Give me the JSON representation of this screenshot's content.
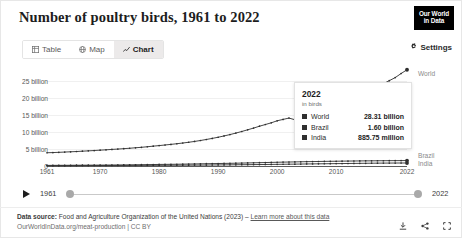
{
  "header": {
    "title": "Number of poultry birds, 1961 to 2022",
    "logo_line1": "Our World",
    "logo_line2": "in Data"
  },
  "tabs": [
    {
      "label": "Table",
      "icon": "table-icon",
      "active": false
    },
    {
      "label": "Map",
      "icon": "globe-icon",
      "active": false
    },
    {
      "label": "Chart",
      "icon": "chart-line-icon",
      "active": true
    }
  ],
  "settings": {
    "label": "Settings",
    "icon": "gear-icon"
  },
  "tooltip": {
    "year": "2022",
    "unit": "in birds",
    "rows": [
      {
        "name": "World",
        "value": "28.31 billion",
        "color": "#2f2f2f"
      },
      {
        "name": "Brazil",
        "value": "1.60 billion",
        "color": "#2f2f2f"
      },
      {
        "name": "India",
        "value": "885.75 million",
        "color": "#2f2f2f"
      }
    ]
  },
  "series_labels": [
    {
      "label": "World",
      "y": 73
    },
    {
      "label": "Brazil",
      "y": 155
    },
    {
      "label": "India",
      "y": 163
    }
  ],
  "timeline": {
    "play_icon": "play-icon",
    "start_year": "1961",
    "end_year": "2022"
  },
  "footer": {
    "source_prefix": "Data source:",
    "source_text": "Food and Agriculture Organization of the United Nations (2023)",
    "source_dash": "–",
    "source_link": "Learn more about this data",
    "license": "OurWorldInData.org/meat-production | CC BY",
    "icons": [
      "download-icon",
      "share-icon",
      "expand-icon"
    ]
  },
  "chart_data": {
    "type": "line",
    "title": "Number of poultry birds, 1961 to 2022",
    "xlabel": "",
    "ylabel": "",
    "unit": "birds",
    "grid": true,
    "legend_position": "right",
    "xlim": [
      1961,
      2022
    ],
    "ylim": [
      0,
      25000000000
    ],
    "ytick_labels": [
      "0",
      "5 billion",
      "10 billion",
      "15 billion",
      "20 billion",
      "25 billion"
    ],
    "ytick_values": [
      0,
      5000000000,
      10000000000,
      15000000000,
      20000000000,
      25000000000
    ],
    "xtick_labels": [
      "1961",
      "1970",
      "1980",
      "1990",
      "2000",
      "2010",
      "2022"
    ],
    "xtick_values": [
      1961,
      1970,
      1980,
      1990,
      2000,
      2010,
      2022
    ],
    "x": [
      1961,
      1962,
      1963,
      1964,
      1965,
      1966,
      1967,
      1968,
      1969,
      1970,
      1971,
      1972,
      1973,
      1974,
      1975,
      1976,
      1977,
      1978,
      1979,
      1980,
      1981,
      1982,
      1983,
      1984,
      1985,
      1986,
      1987,
      1988,
      1989,
      1990,
      1991,
      1992,
      1993,
      1994,
      1995,
      1996,
      1997,
      1998,
      1999,
      2000,
      2001,
      2002,
      2003,
      2004,
      2005,
      2006,
      2007,
      2008,
      2009,
      2010,
      2011,
      2012,
      2013,
      2014,
      2015,
      2016,
      2017,
      2018,
      2019,
      2020,
      2021,
      2022
    ],
    "series": [
      {
        "name": "World",
        "color": "#2f2f2f",
        "end_label": "World",
        "end_value": "28.31 billion",
        "values": [
          3.9,
          3.95,
          4.02,
          4.1,
          4.18,
          4.26,
          4.36,
          4.45,
          4.55,
          4.66,
          4.76,
          4.88,
          4.98,
          5.1,
          5.22,
          5.36,
          5.5,
          5.66,
          5.84,
          6.0,
          6.18,
          6.36,
          6.55,
          6.76,
          6.98,
          7.22,
          7.5,
          7.8,
          8.12,
          8.46,
          8.84,
          9.24,
          9.68,
          10.15,
          10.65,
          11.15,
          11.7,
          12.2,
          12.7,
          13.3,
          13.7,
          14.1,
          13.6,
          14.0,
          14.6,
          15.2,
          15.9,
          16.6,
          17.2,
          17.9,
          18.6,
          19.3,
          20.0,
          20.8,
          21.6,
          22.4,
          23.3,
          24.2,
          25.1,
          26.0,
          27.2,
          28.31
        ]
      },
      {
        "name": "Brazil",
        "color": "#2f2f2f",
        "end_label": "Brazil",
        "end_value": "1.60 billion",
        "values": [
          0.18,
          0.19,
          0.2,
          0.21,
          0.22,
          0.23,
          0.24,
          0.25,
          0.26,
          0.27,
          0.28,
          0.29,
          0.3,
          0.32,
          0.34,
          0.36,
          0.38,
          0.4,
          0.43,
          0.46,
          0.48,
          0.5,
          0.52,
          0.55,
          0.58,
          0.61,
          0.64,
          0.67,
          0.7,
          0.73,
          0.76,
          0.79,
          0.82,
          0.86,
          0.9,
          0.94,
          0.98,
          1.02,
          1.06,
          1.1,
          1.14,
          1.17,
          1.2,
          1.24,
          1.28,
          1.3,
          1.33,
          1.36,
          1.38,
          1.4,
          1.43,
          1.45,
          1.47,
          1.49,
          1.51,
          1.52,
          1.54,
          1.55,
          1.57,
          1.58,
          1.59,
          1.6
        ]
      },
      {
        "name": "India",
        "color": "#2f2f2f",
        "end_label": "India",
        "end_value": "885.75 million",
        "values": [
          0.1,
          0.1,
          0.11,
          0.11,
          0.12,
          0.12,
          0.13,
          0.13,
          0.14,
          0.14,
          0.15,
          0.15,
          0.16,
          0.16,
          0.17,
          0.17,
          0.18,
          0.19,
          0.19,
          0.2,
          0.21,
          0.22,
          0.23,
          0.24,
          0.25,
          0.26,
          0.27,
          0.28,
          0.3,
          0.31,
          0.33,
          0.34,
          0.36,
          0.38,
          0.39,
          0.41,
          0.43,
          0.45,
          0.47,
          0.49,
          0.51,
          0.53,
          0.55,
          0.57,
          0.6,
          0.62,
          0.64,
          0.66,
          0.68,
          0.7,
          0.72,
          0.74,
          0.76,
          0.78,
          0.8,
          0.82,
          0.84,
          0.85,
          0.86,
          0.87,
          0.88,
          0.886
        ]
      }
    ]
  }
}
